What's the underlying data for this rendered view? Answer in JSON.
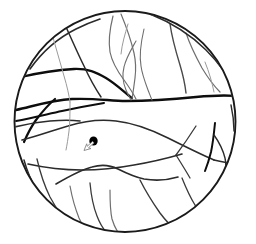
{
  "figure": {
    "canvas": {
      "width": 256,
      "height": 244,
      "background": "#ffffff"
    },
    "boundary": {
      "name": "circular-boundary",
      "shape": "circle",
      "cx": 125,
      "cy": 121.5,
      "r": 110.5,
      "stroke_color": "#1a1a1a",
      "stroke_width": 1.9
    },
    "palette": {
      "heavy": "#0d0d0d",
      "medium": "#2b2b2b",
      "light": "#6f6f6f",
      "faint": "#9a9a9a",
      "lesion": "#000000",
      "marker_outline": "#8c8c8c"
    },
    "lesion": {
      "name": "dark-lesion-blob",
      "label": "dark blob",
      "cx": 93.5,
      "cy": 141.0,
      "rx": 4.2,
      "ry": 4.6,
      "color": "#000000"
    },
    "marker": {
      "name": "arrow-marker",
      "label": "small outlined arrow pointing up-right",
      "x": 84.0,
      "y": 150.5,
      "rotation_deg": -42,
      "scale": 1.0,
      "outline_color": "#8c8c8c",
      "fill_color": "#ffffff"
    },
    "curves": [
      {
        "name": "ridge-major-central",
        "weight": "heavy",
        "width": 2.4,
        "color": "#0d0d0d",
        "d": "M 16 110 C 34 106, 52 100, 72 99 C 96 98, 110 101, 126 101 C 152 101, 176 99, 196 97 C 212 95.5, 226 95, 236 96"
      },
      {
        "name": "ridge-upper-left-branch",
        "weight": "heavy",
        "width": 2.3,
        "color": "#0d0d0d",
        "d": "M 21 77 C 38 73, 56 70, 74 69 C 88 68.5, 96 72, 106 78 C 116 84, 124 92, 132 98"
      },
      {
        "name": "ridge-left-fork-down",
        "weight": "heavy",
        "width": 2.2,
        "color": "#0d0d0d",
        "d": "M 55 99 C 48 105, 42 112, 36 120 C 31 127, 27 135, 24 142"
      },
      {
        "name": "ridge-left-lower-spur",
        "weight": "medium",
        "width": 1.7,
        "color": "#2b2b2b",
        "d": "M 14 127 C 26 124, 38 122, 50 121 C 62 120, 72 120, 80 121"
      },
      {
        "name": "ridge-left-horizontal",
        "weight": "heavy",
        "width": 2.0,
        "color": "#0d0d0d",
        "d": "M 16 121 C 32 118, 48 114, 62 111 C 76 108, 92 105, 104 103"
      },
      {
        "name": "arc-upper-rim-left",
        "weight": "medium",
        "width": 1.6,
        "color": "#2b2b2b",
        "d": "M 30 69 C 42 52, 58 38, 76 29 C 86 24, 94 21, 100 19"
      },
      {
        "name": "arc-upper-left-inner",
        "weight": "medium",
        "width": 1.5,
        "color": "#2b2b2b",
        "d": "M 66 27 C 72 40, 78 54, 84 66 C 89 77, 95 88, 101 97"
      },
      {
        "name": "vein-upper-mid-1",
        "weight": "light",
        "width": 1.2,
        "color": "#6f6f6f",
        "d": "M 113 16 C 110 28, 108 40, 110 52 C 112 62, 118 72, 124 80 C 129 87, 133 93, 136 99"
      },
      {
        "name": "vein-upper-mid-2",
        "weight": "light",
        "width": 1.2,
        "color": "#6f6f6f",
        "d": "M 121 14 C 126 26, 131 40, 134 53 C 136 62, 136 70, 135 78 C 134 86, 133 93, 132 99"
      },
      {
        "name": "vein-upper-mid-3",
        "weight": "light",
        "width": 1.1,
        "color": "#6f6f6f",
        "d": "M 136 41 C 131 50, 126 58, 124 67 C 122 75, 123 83, 126 90 C 128 95, 130 98, 131 100"
      },
      {
        "name": "vein-upper-mid-4",
        "weight": "light",
        "width": 1.1,
        "color": "#6f6f6f",
        "d": "M 144 29 C 141 42, 139 55, 141 66 C 142 74, 145 82, 148 90 C 150 95, 151 98, 152 100"
      },
      {
        "name": "vein-upper-right-1",
        "weight": "medium",
        "width": 1.4,
        "color": "#4a4a4a",
        "d": "M 170 24 C 172 38, 176 52, 180 65 C 183 75, 185 84, 186 93"
      },
      {
        "name": "vein-upper-right-2",
        "weight": "light",
        "width": 1.2,
        "color": "#6f6f6f",
        "d": "M 186 33 C 190 45, 196 57, 202 68 C 208 78, 214 86, 220 92"
      },
      {
        "name": "arc-upper-right-rim",
        "weight": "medium",
        "width": 1.5,
        "color": "#2b2b2b",
        "d": "M 150 14 C 170 22, 190 34, 206 50 C 218 62, 228 76, 234 89"
      },
      {
        "name": "arc-mid-lower-sweep",
        "weight": "medium",
        "width": 1.6,
        "color": "#2b2b2b",
        "d": "M 22 140 C 38 136, 54 130, 68 126 C 84 121, 100 119, 116 121 C 134 123, 152 130, 168 138 C 184 146, 200 154, 214 160"
      },
      {
        "name": "arc-right-lower-rim",
        "weight": "medium",
        "width": 1.7,
        "color": "#2b2b2b",
        "d": "M 214 160 C 222 162, 228 163, 233 163"
      },
      {
        "name": "ridge-right-vertical",
        "weight": "heavy",
        "width": 2.0,
        "color": "#0d0d0d",
        "d": "M 215 123 C 214 133, 213 143, 211 152 C 209 160, 207 166, 205 171"
      },
      {
        "name": "vein-right-small-loop",
        "weight": "medium",
        "width": 1.4,
        "color": "#2b2b2b",
        "d": "M 214 135 C 219 142, 223 150, 225 158 C 226 163, 226 167, 225 170"
      },
      {
        "name": "vein-right-fan-1",
        "weight": "medium",
        "width": 1.3,
        "color": "#3a3a3a",
        "d": "M 196 126 C 189 137, 182 147, 176 155"
      },
      {
        "name": "vein-right-fan-2",
        "weight": "medium",
        "width": 1.3,
        "color": "#3a3a3a",
        "d": "M 176 155 C 181 163, 186 171, 190 178"
      },
      {
        "name": "arc-lower-body",
        "weight": "medium",
        "width": 1.6,
        "color": "#2b2b2b",
        "d": "M 28 164 C 46 168, 64 170, 82 170 C 100 170, 118 168, 134 165 C 152 162, 168 158, 182 154"
      },
      {
        "name": "ridge-lower-mid-wave",
        "weight": "medium",
        "width": 1.6,
        "color": "#2b2b2b",
        "d": "M 56 184 C 68 177, 80 170, 92 167 C 102 164, 110 165, 118 169 C 126 173, 134 177, 144 179 C 156 181, 168 180, 178 177"
      },
      {
        "name": "vein-lower-left-1",
        "weight": "medium",
        "width": 1.3,
        "color": "#3a3a3a",
        "d": "M 37 159 C 40 172, 44 185, 50 197 C 56 208, 63 218, 70 226"
      },
      {
        "name": "vein-lower-left-2",
        "weight": "light",
        "width": 1.2,
        "color": "#6f6f6f",
        "d": "M 70 186 C 72 197, 75 208, 79 218 C 82 225, 85 230, 88 234"
      },
      {
        "name": "vein-lower-mid-1",
        "weight": "medium",
        "width": 1.3,
        "color": "#3a3a3a",
        "d": "M 90 183 C 91 194, 93 206, 97 216 C 100 224, 104 230, 108 234"
      },
      {
        "name": "vein-lower-mid-2",
        "weight": "light",
        "width": 1.2,
        "color": "#6f6f6f",
        "d": "M 110 190 C 110 200, 110 210, 112 219 C 114 226, 117 231, 119 234"
      },
      {
        "name": "vein-lower-right-1",
        "weight": "medium",
        "width": 1.4,
        "color": "#3a3a3a",
        "d": "M 140 180 C 146 192, 153 203, 160 213 C 166 221, 172 227, 177 231"
      },
      {
        "name": "vein-lower-right-2",
        "weight": "medium",
        "width": 1.3,
        "color": "#3a3a3a",
        "d": "M 182 178 C 186 188, 190 197, 195 205 C 200 212, 205 218, 210 222"
      },
      {
        "name": "arc-lower-rim-inner",
        "weight": "medium",
        "width": 1.5,
        "color": "#2b2b2b",
        "d": "M 24 160 C 30 182, 42 202, 58 216 C 72 228, 88 234, 104 236"
      },
      {
        "name": "vein-left-upper-faint",
        "weight": "faint",
        "width": 1.0,
        "color": "#9a9a9a",
        "d": "M 52 34 C 56 48, 60 62, 64 76 C 67 86, 69 95, 70 102"
      },
      {
        "name": "vein-left-mid-faint",
        "weight": "faint",
        "width": 1.0,
        "color": "#9a9a9a",
        "d": "M 70 102 C 70 112, 70 122, 69 131 C 68 139, 67 145, 66 150"
      },
      {
        "name": "vein-upper-right-faint",
        "weight": "faint",
        "width": 1.0,
        "color": "#9a9a9a",
        "d": "M 205 62 C 209 72, 212 82, 214 92"
      },
      {
        "name": "vein-crest-faint-top",
        "weight": "faint",
        "width": 1.0,
        "color": "#9a9a9a",
        "d": "M 128 24 C 125 34, 122 44, 121 54"
      },
      {
        "name": "arc-right-edge-inner",
        "weight": "medium",
        "width": 1.4,
        "color": "#2b2b2b",
        "d": "M 231 105 C 233 114, 234 123, 234 131"
      }
    ]
  }
}
